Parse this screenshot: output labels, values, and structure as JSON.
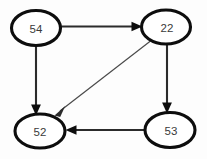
{
  "figure": {
    "width": 207,
    "height": 159,
    "background_color": "#fdfdfd",
    "node_fill_color": "#ffffff",
    "node_stroke_color": "#0d0d0d",
    "label_color": "#3a3a3a",
    "edge_color": "#2b2b2b"
  },
  "graph_data": {
    "type": "diagram",
    "graph_kind": "directed-graph",
    "node_shape": "ellipse",
    "nodes": [
      {
        "id": "n54",
        "label": "54",
        "cx": 36,
        "cy": 28,
        "rx": 24.5,
        "ry": 17.5
      },
      {
        "id": "n22",
        "label": "22",
        "cx": 166,
        "cy": 27,
        "rx": 24.5,
        "ry": 17.0
      },
      {
        "id": "n52",
        "label": "52",
        "cx": 40,
        "cy": 131,
        "rx": 25.0,
        "ry": 17.0
      },
      {
        "id": "n53",
        "label": "53",
        "cx": 170,
        "cy": 130,
        "rx": 25.0,
        "ry": 17.5
      }
    ],
    "edges": [
      {
        "from": "54",
        "to": "22",
        "orientation": "horizontal-top",
        "weight": "thick"
      },
      {
        "from": "54",
        "to": "52",
        "orientation": "vertical-left",
        "weight": "thick"
      },
      {
        "from": "22",
        "to": "53",
        "orientation": "vertical-right",
        "weight": "thick"
      },
      {
        "from": "22",
        "to": "52",
        "orientation": "diagonal",
        "weight": "thin"
      },
      {
        "from": "53",
        "to": "52",
        "orientation": "horizontal-bottom",
        "weight": "thick"
      }
    ]
  }
}
